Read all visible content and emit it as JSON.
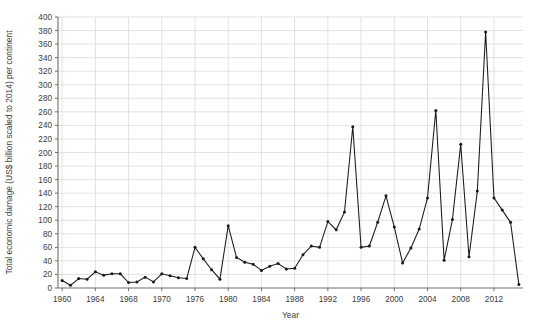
{
  "chart_data": {
    "type": "line",
    "title": "",
    "xlabel": "Year",
    "ylabel": "Total economic damage (US$ billion scaled to 2014) per continent",
    "xlim": [
      1959.5,
      2015.5
    ],
    "ylim": [
      0,
      400
    ],
    "grid": true,
    "legend": false,
    "y_ticks": [
      0,
      20,
      40,
      60,
      80,
      100,
      120,
      140,
      160,
      180,
      200,
      220,
      240,
      260,
      280,
      300,
      320,
      340,
      360,
      380,
      400
    ],
    "x_ticks": [
      1960,
      1964,
      1968,
      1972,
      1976,
      1980,
      1984,
      1988,
      1992,
      1996,
      2000,
      2004,
      2008,
      2012
    ],
    "x_tick_labels": [
      "1960",
      "1964",
      "1968",
      "1970",
      "1976",
      "1980",
      "1984",
      "1988",
      "1992",
      "1996",
      "2000",
      "2004",
      "2008",
      "2012"
    ],
    "marker": "filled-circle",
    "line_color": "#1a1a1a",
    "grid_color": "#cfcfcf",
    "axis_color": "#6e6e6e",
    "series": [
      {
        "name": "Total economic damage",
        "x": [
          1960,
          1961,
          1962,
          1963,
          1964,
          1965,
          1966,
          1967,
          1968,
          1969,
          1970,
          1971,
          1972,
          1973,
          1974,
          1975,
          1976,
          1977,
          1978,
          1979,
          1980,
          1981,
          1982,
          1983,
          1984,
          1985,
          1986,
          1987,
          1988,
          1989,
          1990,
          1991,
          1992,
          1993,
          1994,
          1995,
          1996,
          1997,
          1998,
          1999,
          2000,
          2001,
          2002,
          2003,
          2004,
          2005,
          2006,
          2007,
          2008,
          2009,
          2010,
          2011,
          2012,
          2013,
          2014,
          2015
        ],
        "values": [
          11,
          4,
          14,
          13,
          24,
          19,
          21,
          21,
          8,
          9,
          16,
          9,
          21,
          18,
          15,
          14,
          60,
          43,
          27,
          13,
          92,
          45,
          38,
          35,
          26,
          32,
          36,
          28,
          29,
          49,
          62,
          60,
          98,
          86,
          112,
          238,
          60,
          62,
          97,
          136,
          90,
          37,
          59,
          87,
          133,
          262,
          41,
          101,
          212,
          46,
          143,
          378,
          133,
          115,
          97,
          5
        ]
      }
    ]
  },
  "layout": {
    "plot_left": 58,
    "plot_right": 523,
    "plot_top": 17,
    "plot_bottom": 288
  }
}
